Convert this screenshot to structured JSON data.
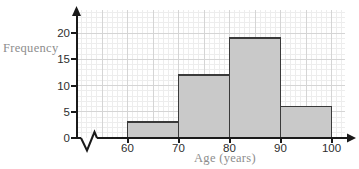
{
  "chart_data": {
    "type": "bar",
    "style": "histogram",
    "title": "",
    "xlabel": "Age (years)",
    "ylabel": "Frequency",
    "bin_edges": [
      60,
      70,
      80,
      90,
      100
    ],
    "frequencies": [
      3,
      12,
      19,
      6
    ],
    "x_ticks": [
      "60",
      "70",
      "80",
      "90",
      "100"
    ],
    "y_ticks": [
      "0",
      "5",
      "10",
      "15",
      "20"
    ],
    "x_tick_values": [
      60,
      70,
      80,
      90,
      100
    ],
    "y_tick_values": [
      0,
      5,
      10,
      15,
      20
    ],
    "xlim": [
      60,
      100
    ],
    "ylim": [
      0,
      24
    ],
    "x_axis_break": true,
    "legend": "none",
    "grid": "graph-paper: minor line every 1 unit, major line every 5 units",
    "colors": {
      "background": "#ffffff",
      "bar_fill": "#c9c9c9",
      "bar_border": "#3a3a3a",
      "axis": "#1a1a1a",
      "tick_label": "#2e2e2e",
      "axis_label": "#8d8d8d",
      "grid_minor": "#ededed",
      "grid_major": "#d5d5d5"
    }
  }
}
